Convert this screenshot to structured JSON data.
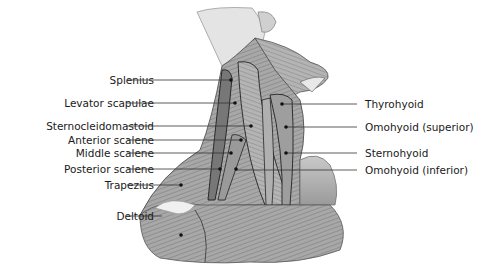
{
  "diagram": {
    "title": "",
    "labels_left": [
      {
        "text": "Splenius",
        "y": 80,
        "point": [
          231,
          80
        ]
      },
      {
        "text": "Levator scapulae",
        "y": 103,
        "point": [
          235,
          103
        ]
      },
      {
        "text": "Sternocleidomastoid",
        "y": 126,
        "point": [
          251,
          126
        ]
      },
      {
        "text": "Anterior scalene",
        "y": 140,
        "point": [
          241,
          140
        ]
      },
      {
        "text": "Middle scalene",
        "y": 153,
        "point": [
          231,
          153
        ]
      },
      {
        "text": "Posterior scalene",
        "y": 169,
        "point": [
          220,
          169
        ]
      },
      {
        "text": "Trapezius",
        "y": 185,
        "point": [
          181,
          185
        ]
      },
      {
        "text": "Deltoid",
        "y": 216,
        "point": [
          170,
          216
        ]
      }
    ],
    "labels_right": [
      {
        "text": "Thyrohyoid",
        "y": 104,
        "point": [
          282,
          104
        ]
      },
      {
        "text": "Omohyoid (superior)",
        "y": 127,
        "point": [
          286,
          127
        ]
      },
      {
        "text": "Sternohyoid",
        "y": 153,
        "point": [
          286,
          153
        ]
      },
      {
        "text": "Omohyoid (inferior)",
        "y": 170,
        "point": [
          286,
          170
        ]
      }
    ]
  }
}
